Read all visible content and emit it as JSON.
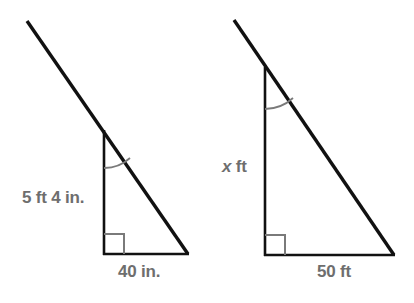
{
  "figure": {
    "type": "similar-right-triangles-diagram",
    "stroke_color": "#111111",
    "marker_color": "#7a7a7a",
    "label_color": "#6e6e6e",
    "background": "#ffffff",
    "triangles": [
      {
        "name": "left-triangle",
        "apex": [
          104,
          130
        ],
        "right_angle_vertex": [
          104,
          254
        ],
        "base_vertex": [
          188,
          254
        ],
        "ray_start": [
          27,
          21
        ],
        "vertical_leg_label": "5 ft 4 in.",
        "base_label": "40 in.",
        "angle_arc_radius": 38,
        "right_angle_marker_size": 20
      },
      {
        "name": "right-triangle",
        "apex": [
          265,
          67
        ],
        "right_angle_vertex": [
          265,
          255
        ],
        "base_vertex": [
          394,
          255
        ],
        "ray_start": [
          234,
          20
        ],
        "vertical_leg_label": "x ft",
        "vertical_leg_label_variable": "x",
        "vertical_leg_label_unit": "ft",
        "base_label": "50 ft",
        "angle_arc_radius": 42,
        "right_angle_marker_size": 20
      }
    ]
  },
  "labels": {
    "left_leg": "5 ft 4 in.",
    "left_base": "40 in.",
    "right_leg_variable": "x",
    "right_leg_unit": "ft",
    "right_base": "50 ft"
  }
}
